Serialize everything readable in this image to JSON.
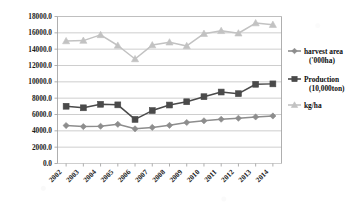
{
  "chart_data": {
    "type": "line",
    "title": "",
    "xlabel": "",
    "ylabel": "",
    "ylim": [
      0,
      18000
    ],
    "ytick_step": 2000,
    "grid": true,
    "legend_position": "right",
    "categories": [
      "2002",
      "2003",
      "2004",
      "2005",
      "2006",
      "2007",
      "2008",
      "2009",
      "2010",
      "2011",
      "2012",
      "2013",
      "2014"
    ],
    "ytick_labels": [
      "18000.0",
      "16000.0",
      "14000.0",
      "12000.0",
      "10000.0",
      "8000.0",
      "6000.0",
      "4000.0",
      "2000.0",
      "0.0"
    ],
    "series": [
      {
        "name": "harvest area ('000ha)",
        "marker": "diamond",
        "color": "#8d8d8d",
        "values": [
          4650,
          4520,
          4560,
          4800,
          4250,
          4420,
          4670,
          5020,
          5230,
          5420,
          5540,
          5700,
          5820
        ]
      },
      {
        "name": "Production (10,000ton)",
        "marker": "square",
        "color": "#4a4a4a",
        "values": [
          7010,
          6820,
          7250,
          7180,
          5400,
          6480,
          7160,
          7560,
          8180,
          8750,
          8550,
          9700,
          9750
        ]
      },
      {
        "name": "kg/ha",
        "marker": "triangle",
        "color": "#c2c2c2",
        "values": [
          15000,
          15050,
          15750,
          14450,
          12800,
          14500,
          14850,
          14400,
          15900,
          16250,
          15950,
          17200,
          17000
        ]
      }
    ]
  },
  "legend": {
    "items": [
      {
        "label_line1": "harvest area",
        "label_line2": "('000ha)",
        "marker": "diamond"
      },
      {
        "label_line1": "Production",
        "label_line2": "(10,000ton)",
        "marker": "square"
      },
      {
        "label_line1": "kg/ha",
        "label_line2": "",
        "marker": "triangle"
      }
    ]
  }
}
